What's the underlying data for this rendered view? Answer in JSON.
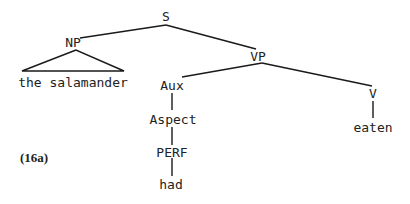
{
  "diagram": {
    "type": "syntax-tree",
    "example_label": "(16a)",
    "nodes": {
      "s": "S",
      "np": "NP",
      "np_leaf": "the salamander",
      "vp": "VP",
      "aux": "Aux",
      "aspect": "Aspect",
      "perf": "PERF",
      "had": "had",
      "v": "V",
      "eaten": "eaten"
    },
    "edges": [
      [
        "S",
        "NP"
      ],
      [
        "S",
        "VP"
      ],
      [
        "NP",
        "the salamander (triangle)"
      ],
      [
        "VP",
        "Aux"
      ],
      [
        "VP",
        "V"
      ],
      [
        "Aux",
        "Aspect"
      ],
      [
        "Aspect",
        "PERF"
      ],
      [
        "PERF",
        "had"
      ],
      [
        "V",
        "eaten"
      ]
    ],
    "colors": {
      "ink": "#222222",
      "background": "#ffffff"
    }
  }
}
